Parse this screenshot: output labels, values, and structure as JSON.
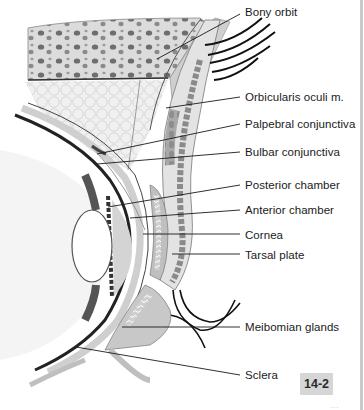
{
  "figure": {
    "figure_number": "14-2",
    "page_number_fragment": "···",
    "labels": [
      {
        "id": "bony-orbit",
        "text": "Bony orbit",
        "x": 245,
        "y": 6
      },
      {
        "id": "orbicularis-oculi",
        "text": "Orbicularis oculi m.",
        "x": 245,
        "y": 91
      },
      {
        "id": "palpebral-conjunctiva",
        "text": "Palpebral conjunctiva",
        "x": 245,
        "y": 118
      },
      {
        "id": "bulbar-conjunctiva",
        "text": "Bulbar conjunctiva",
        "x": 245,
        "y": 146
      },
      {
        "id": "posterior-chamber",
        "text": "Posterior chamber",
        "x": 245,
        "y": 179
      },
      {
        "id": "anterior-chamber",
        "text": "Anterior chamber",
        "x": 245,
        "y": 204
      },
      {
        "id": "cornea",
        "text": "Cornea",
        "x": 245,
        "y": 230
      },
      {
        "id": "tarsal-plate",
        "text": "Tarsal plate",
        "x": 245,
        "y": 250
      },
      {
        "id": "meibomian-glands",
        "text": "Meibomian glands",
        "x": 245,
        "y": 319
      },
      {
        "id": "sclera",
        "text": "Sclera",
        "x": 245,
        "y": 372
      }
    ],
    "colors": {
      "line": "#1a1a1a",
      "tissue_light": "#e6e6e6",
      "tissue_mid": "#bdbdbd",
      "tissue_dark": "#7a7a7a",
      "badge_bg": "#d6d6d6",
      "border": "#c9c9c9"
    }
  }
}
